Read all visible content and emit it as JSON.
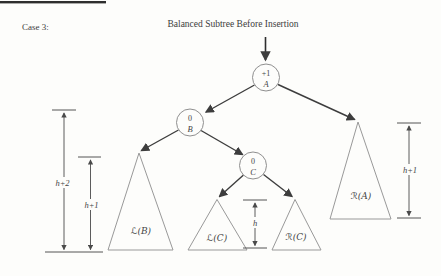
{
  "figure": {
    "case_label": "Case 3:",
    "title": "Balanced Subtree Before Insertion"
  },
  "nodes": {
    "a": {
      "balance": "+1",
      "label": "A"
    },
    "b": {
      "balance": "0",
      "label": "B"
    },
    "c": {
      "balance": "0",
      "label": "C"
    }
  },
  "subtrees": {
    "left_of_b": "ℒ(B)",
    "left_of_c": "ℒ(C)",
    "right_of_c": "ℛ(C)",
    "right_of_a": "ℛ(A)"
  },
  "heights": {
    "outer_left": "h+2",
    "inner_left": "h+1",
    "center": "h",
    "right": "h+1"
  },
  "colors": {
    "background": "#fdfdfb",
    "edge_ink": "#3d3d3d",
    "shape_stroke": "#8f8f8f",
    "text_ink": "#454545"
  }
}
